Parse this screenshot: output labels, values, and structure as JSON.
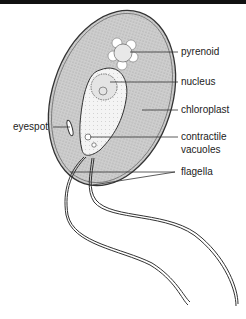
{
  "diagram": {
    "labels": {
      "pyrenoid": "pyrenoid",
      "nucleus": "nucleus",
      "chloroplast": "chloroplast",
      "eyespot": "eyespot",
      "contractile_1": "contractile",
      "contractile_2": "vacuoles",
      "flagella": "flagella"
    },
    "colors": {
      "chloroplast_fill": "#c9c9c9",
      "cytoplasm_fill": "#f2f2f2",
      "outline": "#333333",
      "top_rule": "#111111"
    }
  }
}
